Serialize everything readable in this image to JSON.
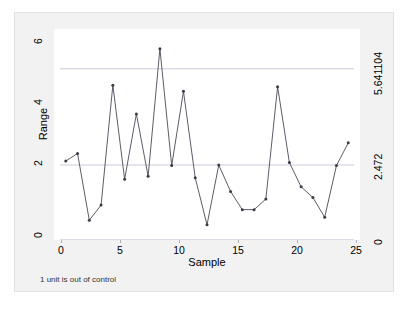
{
  "chart_data": {
    "type": "line",
    "title": "",
    "xlabel": "Sample",
    "ylabel": "Range",
    "x": [
      1,
      2,
      3,
      4,
      5,
      6,
      7,
      8,
      9,
      10,
      11,
      12,
      13,
      14,
      15,
      16,
      17,
      18,
      19,
      20,
      21,
      22,
      23,
      24,
      25
    ],
    "values": [
      2.6,
      2.85,
      0.65,
      1.15,
      5.1,
      2.0,
      4.15,
      2.1,
      6.3,
      2.45,
      4.9,
      2.05,
      0.5,
      2.47,
      1.6,
      1.0,
      1.0,
      1.35,
      5.05,
      2.55,
      1.75,
      1.4,
      0.75,
      2.45,
      3.2
    ],
    "series": [
      {
        "name": "Range",
        "values": [
          2.6,
          2.85,
          0.65,
          1.15,
          5.1,
          2.0,
          4.15,
          2.1,
          6.3,
          2.45,
          4.9,
          2.05,
          0.5,
          2.47,
          1.6,
          1.0,
          1.0,
          1.35,
          5.05,
          2.55,
          1.75,
          1.4,
          0.75,
          2.45,
          3.2
        ]
      }
    ],
    "xlim": [
      0,
      26
    ],
    "ylim": [
      0,
      6.95
    ],
    "x_ticks": [
      "0",
      "5",
      "10",
      "15",
      "20",
      "25"
    ],
    "x_tick_values": [
      0,
      5,
      10,
      15,
      20,
      25
    ],
    "y_ticks": [
      "0",
      "2",
      "4",
      "6"
    ],
    "y_tick_values": [
      0,
      2,
      4,
      6
    ],
    "grid": false,
    "legend": "none",
    "control_limits": {
      "ucl_label": "5.641104",
      "ucl_value": 5.641104,
      "center_label": "2.472",
      "center_value": 2.472,
      "lcl_label": "0",
      "lcl_value": 0
    },
    "annotations": {
      "note": "1 unit is out of control"
    },
    "colors": {
      "line": "#4a4a57",
      "marker": "#3b3b47",
      "limit_line": "#d9d9e6",
      "plot_background": "#ffffff",
      "graph_background": "#f2f2f2"
    }
  },
  "axes": {
    "y_title": "Range",
    "x_title": "Sample",
    "y_tick_labels": [
      "6",
      "4",
      "2",
      "0"
    ],
    "x_tick_labels": [
      "0",
      "5",
      "10",
      "15",
      "20",
      "25"
    ],
    "right_tick_labels": [
      "5.641104",
      "2.472",
      "0"
    ]
  },
  "caption": {
    "text": "1 unit is out of control"
  }
}
